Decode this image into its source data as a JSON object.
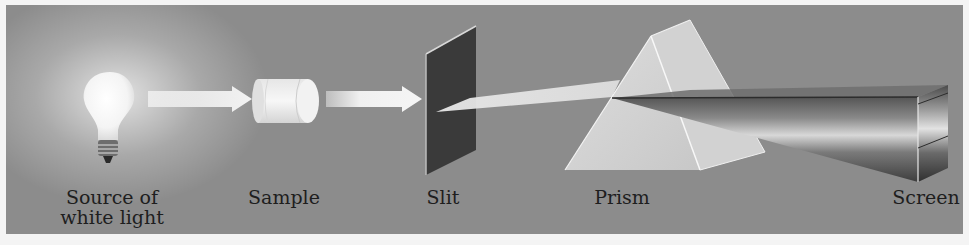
{
  "diagram": {
    "type": "spectroscopy-setup",
    "components": [
      {
        "id": "source",
        "label_line1": "Source of",
        "label_line2": "white light"
      },
      {
        "id": "sample",
        "label": "Sample"
      },
      {
        "id": "slit",
        "label": "Slit"
      },
      {
        "id": "prism",
        "label": "Prism"
      },
      {
        "id": "screen",
        "label": "Screen"
      }
    ],
    "colors": {
      "background": "#8c8c8c",
      "border": "#f4f4f4",
      "beam": "#f2f2f2",
      "slit": "#3a3a3a",
      "label_text": "#1e1e1e"
    }
  }
}
